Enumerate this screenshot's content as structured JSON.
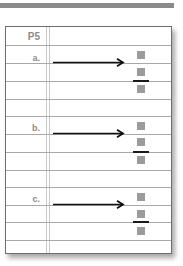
{
  "header": {
    "title": "P5"
  },
  "rows": [
    {
      "label": "a.",
      "arrow": "right-arrow",
      "boxes": [
        "box",
        "box",
        "box"
      ],
      "divider": "fraction-bar"
    },
    {
      "label": "b.",
      "arrow": "right-arrow",
      "boxes": [
        "box",
        "box",
        "box"
      ],
      "divider": "fraction-bar"
    },
    {
      "label": "c.",
      "arrow": "right-arrow",
      "boxes": [
        "box",
        "box",
        "box"
      ],
      "divider": "fraction-bar"
    }
  ],
  "colors": {
    "box": "#9b9b9b",
    "bar": "#1a1a1a",
    "rule": "#a9a9a9",
    "label": "#8c8c8c",
    "top_bar": "#8a8a8a"
  }
}
